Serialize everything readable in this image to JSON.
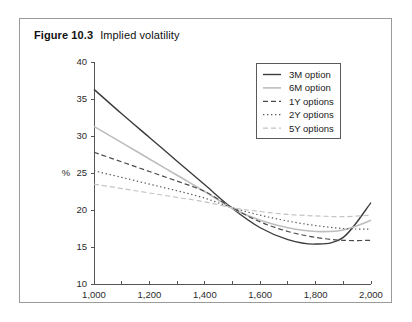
{
  "figure": {
    "label": "Figure 10.3",
    "title": "Implied volatility"
  },
  "chart_data": {
    "type": "line",
    "title": "Implied volatility",
    "xlabel": "",
    "ylabel": "%",
    "xlim": [
      1000,
      2000
    ],
    "ylim": [
      10,
      40
    ],
    "xticks": [
      1000,
      1200,
      1400,
      1600,
      1800,
      2000
    ],
    "xticklabels": [
      "1,000",
      "1,200",
      "1,400",
      "1,600",
      "1,800",
      "2,000"
    ],
    "xminorticks": [
      1100,
      1300,
      1500,
      1700,
      1900
    ],
    "yticks": [
      10,
      15,
      20,
      25,
      30,
      35,
      40
    ],
    "yticklabels": [
      "10",
      "15",
      "20",
      "25",
      "30",
      "35",
      "40"
    ],
    "grid": false,
    "legend_position": "upper right",
    "x": [
      1000,
      1100,
      1200,
      1300,
      1400,
      1500,
      1600,
      1700,
      1800,
      1900,
      2000
    ],
    "series": [
      {
        "name": "3M option",
        "values": [
          36.3,
          33.0,
          29.8,
          26.6,
          23.4,
          20.2,
          17.6,
          16.0,
          15.4,
          16.3,
          21.0
        ],
        "color": "#3c3c3c",
        "style": "solid",
        "width": 1.4
      },
      {
        "name": "6M option",
        "values": [
          31.3,
          29.1,
          26.9,
          24.7,
          22.5,
          20.2,
          18.6,
          17.6,
          17.1,
          17.3,
          18.6
        ],
        "color": "#bdbdbd",
        "style": "solid",
        "width": 1.6
      },
      {
        "name": "1Y options",
        "values": [
          27.8,
          26.5,
          25.2,
          23.9,
          22.5,
          20.3,
          18.4,
          17.1,
          16.3,
          15.9,
          15.9
        ],
        "color": "#4a4a4a",
        "style": "dashed",
        "width": 1.2
      },
      {
        "name": "2Y options",
        "values": [
          25.3,
          24.4,
          23.5,
          22.6,
          21.6,
          20.3,
          19.3,
          18.5,
          17.9,
          17.5,
          17.4
        ],
        "color": "#5a5a5a",
        "style": "dotted",
        "width": 1.2
      },
      {
        "name": "5Y options",
        "values": [
          23.5,
          22.9,
          22.3,
          21.7,
          21.1,
          20.3,
          19.8,
          19.4,
          19.2,
          19.1,
          19.3
        ],
        "color": "#c4c4c4",
        "style": "dashed",
        "width": 1.2
      }
    ]
  }
}
